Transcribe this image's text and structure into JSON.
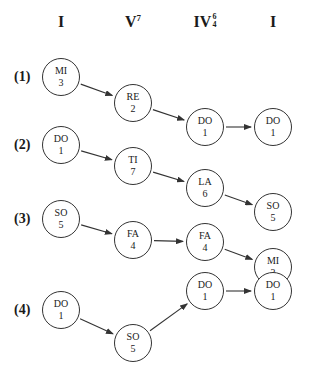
{
  "columns": [
    {
      "label": "I",
      "x": 61
    },
    {
      "label": "V",
      "superscript": "7",
      "x": 133
    },
    {
      "label": "IV",
      "figure_top": "6",
      "figure_bottom": "4",
      "x": 205
    },
    {
      "label": "I",
      "x": 273
    }
  ],
  "rows": [
    {
      "label": "(1)",
      "y": 77,
      "nodes": [
        {
          "syllable": "MI",
          "degree": "3",
          "x": 61,
          "y": 77
        },
        {
          "syllable": "RE",
          "degree": "2",
          "x": 133,
          "y": 103
        },
        {
          "syllable": "DO",
          "degree": "1",
          "x": 205,
          "y": 127
        },
        {
          "syllable": "DO",
          "degree": "1",
          "x": 273,
          "y": 127
        }
      ]
    },
    {
      "label": "(2)",
      "y": 145,
      "nodes": [
        {
          "syllable": "DO",
          "degree": "1",
          "x": 61,
          "y": 145
        },
        {
          "syllable": "TI",
          "degree": "7",
          "x": 133,
          "y": 166
        },
        {
          "syllable": "LA",
          "degree": "6",
          "x": 205,
          "y": 188
        },
        {
          "syllable": "SO",
          "degree": "5",
          "x": 273,
          "y": 212
        }
      ]
    },
    {
      "label": "(3)",
      "y": 219,
      "nodes": [
        {
          "syllable": "SO",
          "degree": "5",
          "x": 61,
          "y": 219
        },
        {
          "syllable": "FA",
          "degree": "4",
          "x": 133,
          "y": 240
        },
        {
          "syllable": "FA",
          "degree": "4",
          "x": 205,
          "y": 242
        },
        {
          "syllable": "MI",
          "degree": "3",
          "x": 273,
          "y": 267
        }
      ]
    },
    {
      "label": "(4)",
      "y": 310,
      "nodes": [
        {
          "syllable": "DO",
          "degree": "1",
          "x": 61,
          "y": 310
        },
        {
          "syllable": "SO",
          "degree": "5",
          "x": 133,
          "y": 343
        },
        {
          "syllable": "DO",
          "degree": "1",
          "x": 205,
          "y": 291
        },
        {
          "syllable": "DO",
          "degree": "1",
          "x": 273,
          "y": 291
        }
      ]
    }
  ],
  "style": {
    "line_color": "#333333",
    "node_radius": 19
  }
}
